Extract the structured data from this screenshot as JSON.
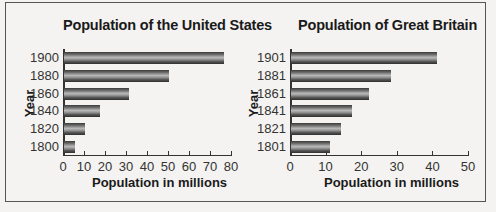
{
  "chart_data": [
    {
      "type": "bar",
      "orientation": "horizontal",
      "title": "Population of the United States",
      "xlabel": "Population in millions",
      "ylabel": "Year",
      "categories": [
        "1900",
        "1880",
        "1860",
        "1840",
        "1820",
        "1800"
      ],
      "values": [
        76,
        50,
        31,
        17,
        10,
        5
      ],
      "xlim": [
        0,
        80
      ],
      "xticks": [
        "0",
        "10",
        "20",
        "30",
        "40",
        "50",
        "60",
        "70",
        "80"
      ],
      "grid": false,
      "legend": null
    },
    {
      "type": "bar",
      "orientation": "horizontal",
      "title": "Population of Great Britain",
      "xlabel": "Population in millions",
      "ylabel": "Year",
      "categories": [
        "1901",
        "1881",
        "1861",
        "1841",
        "1821",
        "1801"
      ],
      "values": [
        41,
        28,
        22,
        17,
        14,
        11
      ],
      "xlim": [
        0,
        50
      ],
      "xticks": [
        "0",
        "10",
        "20",
        "30",
        "40",
        "50"
      ],
      "grid": false,
      "legend": null
    }
  ]
}
